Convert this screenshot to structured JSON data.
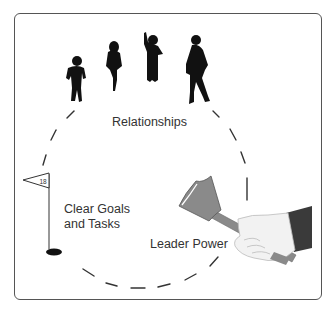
{
  "diagram": {
    "labels": {
      "relationships": "Relationships",
      "goals_line1": "Clear Goals",
      "goals_line2": "and Tasks",
      "leader_power": "Leader Power"
    },
    "flag_number": "18",
    "elements": [
      {
        "name": "people-silhouettes",
        "count": 4,
        "represents": "Relationships"
      },
      {
        "name": "golf-flag-and-hole",
        "represents": "Clear Goals and Tasks"
      },
      {
        "name": "hand-with-gavel",
        "represents": "Leader Power"
      },
      {
        "name": "dashed-circle",
        "connects": [
          "Relationships",
          "Clear Goals and Tasks",
          "Leader Power"
        ]
      }
    ],
    "colors": {
      "frame": "#555555",
      "silhouette": "#111111",
      "gavel": "#8a8a8a",
      "sleeve": "#3a3a3a",
      "hand": "#f2f2f2",
      "dash": "#333333"
    }
  }
}
